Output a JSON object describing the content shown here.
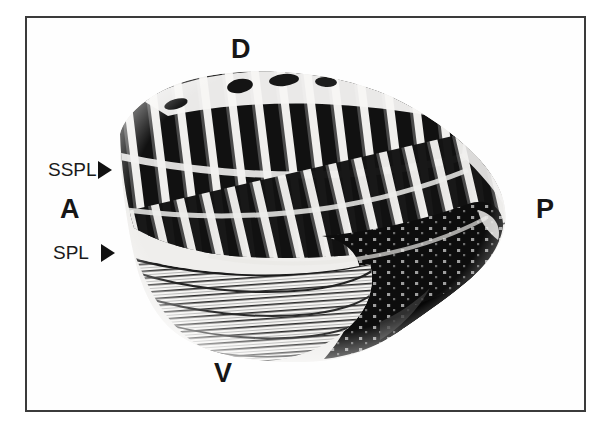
{
  "figure": {
    "kind": "micrograph",
    "caption_labels": {
      "dorsal": "D",
      "ventral": "V",
      "anterior": "A",
      "posterior": "P"
    },
    "annotations": [
      {
        "id": "sspl",
        "label": "SSPL",
        "marker": "right-arrowhead"
      },
      {
        "id": "spl",
        "label": "SPL",
        "marker": "right-arrowhead"
      }
    ],
    "colors": {
      "frame": "#3b3b3b",
      "background": "#ffffff",
      "text": "#161616",
      "specimen_dark": "#101010",
      "specimen_light": "#f2f2f2"
    }
  }
}
